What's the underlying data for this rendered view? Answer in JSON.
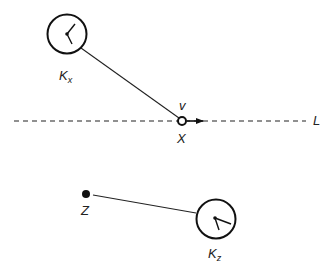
{
  "diagram": {
    "labels": {
      "clock_x": "K",
      "clock_x_sub": "x",
      "point_x": "X",
      "velocity": "v",
      "line": "L",
      "point_z": "Z",
      "clock_z": "K",
      "clock_z_sub": "z"
    },
    "elements": {
      "clock_x": {
        "cx": 67,
        "cy": 34,
        "r": 20
      },
      "point_x": {
        "cx": 182,
        "cy": 121,
        "r": 4,
        "style": "hollow"
      },
      "line_L": {
        "y": 121,
        "x1": 14,
        "x2": 306,
        "style": "dashed"
      },
      "velocity_arrow": {
        "x1": 186,
        "x2": 202,
        "y": 121
      },
      "point_z": {
        "cx": 86,
        "cy": 194,
        "r": 4,
        "style": "filled"
      },
      "clock_z": {
        "cx": 216,
        "cy": 219,
        "r": 20
      }
    },
    "colors": {
      "stroke": "#111111",
      "background": "#ffffff"
    }
  }
}
